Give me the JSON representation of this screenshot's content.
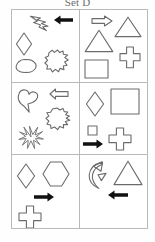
{
  "title": "Set D",
  "puzzle": {
    "kind": "visual-reasoning-matrix",
    "rows": 3,
    "columns": 2,
    "cells": [
      {
        "id": "cell-1",
        "position": "top-left",
        "shapes": [
          {
            "name": "lightning-bolt-shape",
            "fill": "outline"
          },
          {
            "name": "left-arrow-shape",
            "fill": "solid-black"
          },
          {
            "name": "diamond-shape",
            "fill": "outline"
          },
          {
            "name": "cloud-blob-shape",
            "fill": "outline"
          },
          {
            "name": "jagged-blob-shape",
            "fill": "outline"
          }
        ]
      },
      {
        "id": "cell-2",
        "position": "top-right",
        "shapes": [
          {
            "name": "right-arrow-shape",
            "fill": "outline"
          },
          {
            "name": "triangle-shape",
            "fill": "outline"
          },
          {
            "name": "triangle-shape",
            "fill": "outline"
          },
          {
            "name": "cross-shape",
            "fill": "outline"
          },
          {
            "name": "square-shape",
            "fill": "outline"
          }
        ]
      },
      {
        "id": "cell-3",
        "position": "middle-left",
        "shapes": [
          {
            "name": "heart-blob-shape",
            "fill": "outline"
          },
          {
            "name": "left-arrow-shape",
            "fill": "outline"
          },
          {
            "name": "jagged-blob-shape",
            "fill": "outline"
          },
          {
            "name": "starburst-shape",
            "fill": "outline"
          }
        ]
      },
      {
        "id": "cell-4",
        "position": "middle-right",
        "shapes": [
          {
            "name": "diamond-shape",
            "fill": "outline"
          },
          {
            "name": "square-shape",
            "fill": "outline"
          },
          {
            "name": "small-square-shape",
            "fill": "outline"
          },
          {
            "name": "right-arrow-shape",
            "fill": "solid-black"
          },
          {
            "name": "cross-shape",
            "fill": "outline"
          }
        ]
      },
      {
        "id": "cell-5",
        "position": "bottom-left",
        "shapes": [
          {
            "name": "diamond-shape",
            "fill": "outline"
          },
          {
            "name": "hexagon-shape",
            "fill": "outline"
          },
          {
            "name": "right-arrow-shape",
            "fill": "solid-black"
          },
          {
            "name": "cross-shape",
            "fill": "outline"
          }
        ]
      },
      {
        "id": "cell-6",
        "position": "bottom-right",
        "shapes": [
          {
            "name": "crescent-arrow-shape",
            "fill": "outline"
          },
          {
            "name": "triangle-shape",
            "fill": "outline"
          },
          {
            "name": "left-arrow-shape",
            "fill": "solid-black"
          }
        ]
      }
    ]
  },
  "colors": {
    "outline_stroke": "#6b6b6b",
    "solid_fill": "#111111",
    "grid_border": "#b9b9b9",
    "background": "#ffffff",
    "title_text": "#6e6e6e"
  }
}
